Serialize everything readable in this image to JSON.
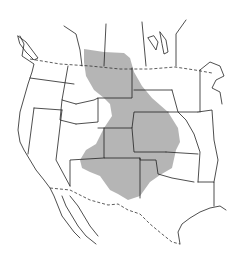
{
  "map": {
    "type": "species range map",
    "region": "North America (western and central United States)",
    "range_color": "#a8a8a8",
    "line_color": "#222222",
    "background": "#ffffff"
  }
}
